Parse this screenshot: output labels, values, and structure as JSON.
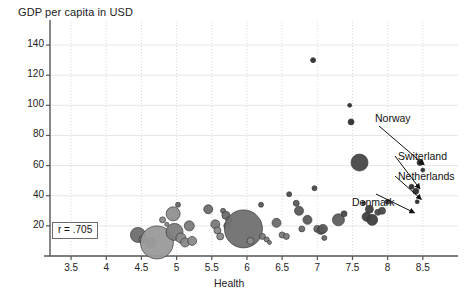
{
  "chart_data": {
    "type": "scatter",
    "title": "GDP per capita in USD",
    "xlabel": "Health",
    "ylabel": "",
    "xlim": [
      3.2,
      9.0
    ],
    "ylim": [
      0,
      150
    ],
    "xticks": [
      "3.5",
      "4",
      "4.5",
      "5",
      "5.5",
      "6",
      "6.5",
      "7",
      "7.5",
      "8",
      "8.5"
    ],
    "xtick_values": [
      3.5,
      4,
      4.5,
      5,
      5.5,
      6,
      6.5,
      7,
      7.5,
      8,
      8.5
    ],
    "yticks": [
      "20",
      "40",
      "60",
      "80",
      "100",
      "120",
      "140"
    ],
    "ytick_values": [
      20,
      40,
      60,
      80,
      100,
      120,
      140
    ],
    "grid": true,
    "grid_style": "dotted-light-gray",
    "legend": "none",
    "correlation_label": "r = .705",
    "marker_style": "bubble (size = population)",
    "points": [
      {
        "x": 4.45,
        "y": 14,
        "r": 7.5,
        "shade": "#6e6e6e"
      },
      {
        "x": 4.52,
        "y": 11,
        "r": 4.0,
        "shade": "#7a7a7a"
      },
      {
        "x": 4.63,
        "y": 9,
        "r": 5.0,
        "shade": "#8c8c8c"
      },
      {
        "x": 4.72,
        "y": 9,
        "r": 16.5,
        "shade": "#9a9a9a"
      },
      {
        "x": 4.8,
        "y": 24,
        "r": 3.0,
        "shade": "#8a8a8a"
      },
      {
        "x": 4.86,
        "y": 21,
        "r": 2.0,
        "shade": "#8a8a8a"
      },
      {
        "x": 4.95,
        "y": 28,
        "r": 7.0,
        "shade": "#909090"
      },
      {
        "x": 4.97,
        "y": 16,
        "r": 8.5,
        "shade": "#7d7d7d"
      },
      {
        "x": 5.02,
        "y": 34,
        "r": 2.5,
        "shade": "#6a6a6a"
      },
      {
        "x": 5.06,
        "y": 12,
        "r": 5.0,
        "shade": "#8a8a8a"
      },
      {
        "x": 5.12,
        "y": 9,
        "r": 4.5,
        "shade": "#8a8a8a"
      },
      {
        "x": 5.18,
        "y": 20,
        "r": 5.0,
        "shade": "#7b7b7b"
      },
      {
        "x": 5.22,
        "y": 10,
        "r": 4.5,
        "shade": "#8a8a8a"
      },
      {
        "x": 5.45,
        "y": 31,
        "r": 4.5,
        "shade": "#6d6d6d"
      },
      {
        "x": 5.55,
        "y": 21,
        "r": 4.5,
        "shade": "#7b7b7b"
      },
      {
        "x": 5.58,
        "y": 17,
        "r": 3.5,
        "shade": "#8a8a8a"
      },
      {
        "x": 5.62,
        "y": 13,
        "r": 3.5,
        "shade": "#8a8a8a"
      },
      {
        "x": 5.66,
        "y": 30,
        "r": 2.5,
        "shade": "#6d6d6d"
      },
      {
        "x": 5.7,
        "y": 27,
        "r": 4.0,
        "shade": "#6d6d6d"
      },
      {
        "x": 5.74,
        "y": 24,
        "r": 3.0,
        "shade": "#7b7b7b"
      },
      {
        "x": 5.72,
        "y": 20,
        "r": 3.5,
        "shade": "#7b7b7b"
      },
      {
        "x": 5.95,
        "y": 18,
        "r": 19.0,
        "shade": "#707070"
      },
      {
        "x": 6.05,
        "y": 10,
        "r": 3.5,
        "shade": "#8a8a8a"
      },
      {
        "x": 6.2,
        "y": 34,
        "r": 2.5,
        "shade": "#5a5a5a"
      },
      {
        "x": 6.22,
        "y": 13,
        "r": 3.0,
        "shade": "#7b7b7b"
      },
      {
        "x": 6.28,
        "y": 11,
        "r": 2.5,
        "shade": "#7b7b7b"
      },
      {
        "x": 6.32,
        "y": 9,
        "r": 2.0,
        "shade": "#7b7b7b"
      },
      {
        "x": 6.42,
        "y": 22,
        "r": 4.5,
        "shade": "#6a6a6a"
      },
      {
        "x": 6.5,
        "y": 14,
        "r": 3.0,
        "shade": "#7b7b7b"
      },
      {
        "x": 6.56,
        "y": 13,
        "r": 3.0,
        "shade": "#7b7b7b"
      },
      {
        "x": 6.6,
        "y": 41,
        "r": 2.5,
        "shade": "#4a4a4a"
      },
      {
        "x": 6.7,
        "y": 35,
        "r": 3.0,
        "shade": "#5a5a5a"
      },
      {
        "x": 6.74,
        "y": 30,
        "r": 4.5,
        "shade": "#5a5a5a"
      },
      {
        "x": 6.78,
        "y": 18,
        "r": 3.0,
        "shade": "#6a6a6a"
      },
      {
        "x": 6.86,
        "y": 24,
        "r": 4.5,
        "shade": "#5a5a5a"
      },
      {
        "x": 6.94,
        "y": 130,
        "r": 2.5,
        "shade": "#2c2c2c"
      },
      {
        "x": 6.96,
        "y": 45,
        "r": 2.5,
        "shade": "#4a4a4a"
      },
      {
        "x": 7.0,
        "y": 18,
        "r": 3.5,
        "shade": "#6a6a6a"
      },
      {
        "x": 7.05,
        "y": 17,
        "r": 4.0,
        "shade": "#5a5a5a"
      },
      {
        "x": 7.08,
        "y": 18,
        "r": 4.5,
        "shade": "#5a5a5a"
      },
      {
        "x": 7.1,
        "y": 12,
        "r": 2.5,
        "shade": "#6a6a6a"
      },
      {
        "x": 7.3,
        "y": 24,
        "r": 6.0,
        "shade": "#5e5e5e"
      },
      {
        "x": 7.38,
        "y": 28,
        "r": 3.0,
        "shade": "#4a4a4a"
      },
      {
        "x": 7.46,
        "y": 100,
        "r": 2.0,
        "shade": "#2c2c2c"
      },
      {
        "x": 7.48,
        "y": 89,
        "r": 3.0,
        "shade": "#2c2c2c"
      },
      {
        "x": 7.6,
        "y": 62,
        "r": 8.5,
        "shade": "#474747"
      },
      {
        "x": 7.66,
        "y": 35,
        "r": 2.0,
        "shade": "#3c3c3c"
      },
      {
        "x": 7.7,
        "y": 26,
        "r": 4.5,
        "shade": "#3f3f3f"
      },
      {
        "x": 7.74,
        "y": 31,
        "r": 4.0,
        "shade": "#3f3f3f"
      },
      {
        "x": 7.78,
        "y": 24,
        "r": 5.5,
        "shade": "#3f3f3f"
      },
      {
        "x": 7.86,
        "y": 29,
        "r": 3.0,
        "shade": "#4a4a4a"
      },
      {
        "x": 7.92,
        "y": 30,
        "r": 3.5,
        "shade": "#4a4a4a"
      },
      {
        "x": 8.0,
        "y": 36,
        "r": 2.5,
        "shade": "#3c3c3c"
      },
      {
        "x": 8.34,
        "y": 46,
        "r": 2.5,
        "shade": "#2c2c2c"
      },
      {
        "x": 8.4,
        "y": 43,
        "r": 3.0,
        "shade": "#2c2c2c"
      },
      {
        "x": 8.42,
        "y": 36,
        "r": 2.0,
        "shade": "#2c2c2c"
      },
      {
        "x": 8.46,
        "y": 62,
        "r": 3.0,
        "shade": "#2c2c2c"
      },
      {
        "x": 8.5,
        "y": 57,
        "r": 2.0,
        "shade": "#2c2c2c"
      }
    ],
    "annotations": [
      {
        "label": "Norway",
        "x": 8.46,
        "y": 62
      },
      {
        "label": "Switerland",
        "x": 8.4,
        "y": 46
      },
      {
        "label": "Netherlands",
        "x": 8.42,
        "y": 39
      },
      {
        "label": "Denmark",
        "x": 8.38,
        "y": 34
      }
    ]
  },
  "colors": {
    "axis": "#555555",
    "grid": "#d9d9d9",
    "text": "#1a1a1a",
    "bubble_light": "#9a9a9a",
    "bubble_dark": "#2c2c2c"
  }
}
